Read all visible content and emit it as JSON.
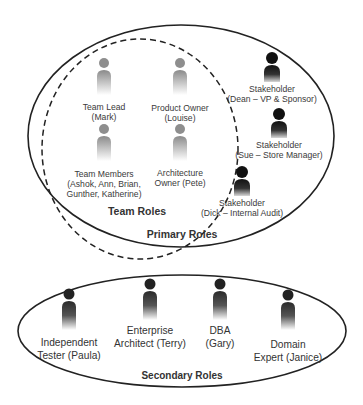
{
  "colors": {
    "outline": "#222222",
    "team_figure": "#8a8a8a",
    "stakeholder_figure": "#1a1a1a",
    "secondary_figure": "#333333",
    "text": "#333333"
  },
  "groups": {
    "team_roles": {
      "label": "Team Roles",
      "style": "dashed-circle"
    },
    "primary_roles": {
      "label": "Primary Roles",
      "style": "solid-ellipse"
    },
    "secondary_roles": {
      "label": "Secondary Roles",
      "style": "solid-ellipse"
    }
  },
  "team_roles": [
    {
      "role": "Team Lead",
      "name": "(Mark)",
      "icon": "person-icon"
    },
    {
      "role": "Product Owner",
      "name": "(Louise)",
      "icon": "person-icon"
    },
    {
      "role": "Team Members",
      "name_line1": "(Ashok, Ann, Brian,",
      "name_line2": "Gunther, Katherine)",
      "icon": "person-icon"
    },
    {
      "role": "Architecture",
      "name": "Owner (Pete)",
      "icon": "person-icon"
    }
  ],
  "stakeholders": [
    {
      "role": "Stakeholder",
      "name": "(Dean – VP & Sponsor)",
      "icon": "person-icon"
    },
    {
      "role": "Stakeholder",
      "name": "(Sue – Store Manager)",
      "icon": "person-icon"
    },
    {
      "role": "Stakeholder",
      "name": "(Dick – Internal Audit)",
      "icon": "person-icon"
    }
  ],
  "secondary_roles": [
    {
      "line1": "Independent",
      "line2": "Tester (Paula)",
      "icon": "person-icon"
    },
    {
      "line1": "Enterprise",
      "line2": "Architect (Terry)",
      "icon": "person-icon"
    },
    {
      "line1": "DBA",
      "line2": "(Gary)",
      "icon": "person-icon"
    },
    {
      "line1": "Domain",
      "line2": "Expert (Janice)",
      "icon": "person-icon"
    }
  ]
}
